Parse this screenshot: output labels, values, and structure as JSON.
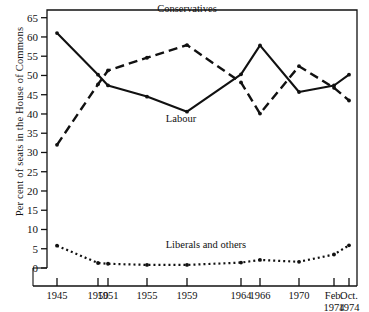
{
  "chart_data": {
    "type": "line",
    "title": "",
    "xlabel": "",
    "ylabel": "Per cent of seats in the House of Commons",
    "categories": [
      "1945",
      "1950",
      "1951",
      "1955",
      "1959",
      "1964",
      "1966",
      "1970",
      "Feb. 1974",
      "Oct. 1974"
    ],
    "x_tick_labels": [
      {
        "line1": "1945",
        "line2": ""
      },
      {
        "line1": "1950",
        "line2": ""
      },
      {
        "line1": "1951",
        "line2": ""
      },
      {
        "line1": "1955",
        "line2": ""
      },
      {
        "line1": "1959",
        "line2": ""
      },
      {
        "line1": "1964",
        "line2": ""
      },
      {
        "line1": "1966",
        "line2": ""
      },
      {
        "line1": "1970",
        "line2": ""
      },
      {
        "line1": "Feb.",
        "line2": "1974"
      },
      {
        "line1": "Oct.",
        "line2": "1974"
      }
    ],
    "y_ticks": [
      0,
      5,
      10,
      15,
      20,
      25,
      30,
      35,
      40,
      45,
      50,
      55,
      60,
      65
    ],
    "ylim": [
      0,
      67
    ],
    "grid": false,
    "legend_position": "inline-annotations",
    "series": [
      {
        "name": "Labour",
        "style": "solid",
        "label_text": "Labour",
        "values": [
          61.0,
          50.2,
          47.4,
          44.5,
          40.6,
          50.3,
          57.8,
          45.7,
          47.4,
          50.2
        ]
      },
      {
        "name": "Conservatives",
        "style": "dashed",
        "label_text": "Conservatives",
        "values": [
          32.0,
          47.7,
          51.3,
          54.6,
          57.9,
          48.2,
          40.1,
          52.4,
          46.8,
          43.5
        ]
      },
      {
        "name": "Liberals and others",
        "style": "dotted",
        "label_text": "Liberals and others",
        "values": [
          5.8,
          1.3,
          1.1,
          0.8,
          0.8,
          1.4,
          2.1,
          1.6,
          3.5,
          5.9
        ]
      }
    ],
    "annotations": [
      {
        "text": "Conservatives",
        "x_index": 4,
        "y_value": 66.5
      },
      {
        "text": "Labour",
        "x_index": 3.85,
        "y_value": 38.0
      },
      {
        "text": "Liberals and others",
        "x_index": 4.35,
        "y_value": 5.2
      }
    ]
  }
}
